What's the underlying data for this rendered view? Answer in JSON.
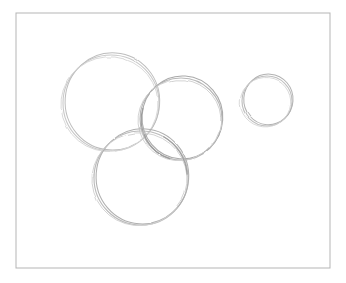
{
  "artwork": {
    "title": "Pencil sketch of four overlapping circles",
    "medium": "graphite pencil on white paper",
    "caption": "",
    "background_color": "#ffffff",
    "width": 346,
    "height": 283
  },
  "frame": {
    "name": "drawing-border",
    "shape": "rectangle",
    "stroke_color": "#b5b5b5",
    "stroke_width": 1,
    "x": 16,
    "y": 13,
    "width": 314,
    "height": 255
  },
  "palette": {
    "paper": "#ffffff",
    "frame_line": "#b5b5b5",
    "stroke_faint": "#d2d2d2",
    "stroke_light": "#c2c2c2",
    "stroke_mid": "#ababab",
    "stroke_dark": "#9a9a9a"
  },
  "shapes": [
    {
      "name": "large-circle",
      "label": "Large circle (upper left)",
      "cx": 111,
      "cy": 103,
      "r": 48,
      "stroke_color": "#c4c4c4",
      "stroke_width": 1.1,
      "passes": 2
    },
    {
      "name": "medium-circle",
      "label": "Medium circle (upper middle right)",
      "cx": 181,
      "cy": 119,
      "r": 41,
      "stroke_color": "#b4b4b4",
      "stroke_width": 1.1,
      "passes": 2
    },
    {
      "name": "bottom-circle",
      "label": "Bottom circle (lower middle)",
      "cx": 141,
      "cy": 178,
      "r": 47,
      "stroke_color": "#b8b8b8",
      "stroke_width": 1.1,
      "passes": 2
    },
    {
      "name": "small-circle",
      "label": "Small circle (right side, isolated)",
      "cx": 267,
      "cy": 101,
      "r": 25,
      "stroke_color": "#bdbdbd",
      "stroke_width": 1.1,
      "passes": 2
    }
  ]
}
